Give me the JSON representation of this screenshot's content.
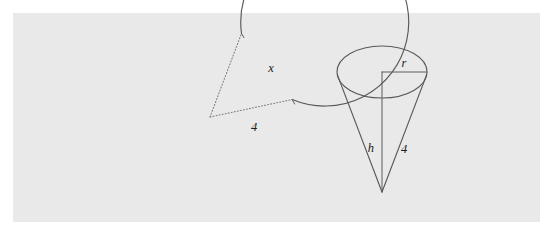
{
  "figure": {
    "background_color": "#ffffff",
    "panel_color": "#e9e9e9",
    "stroke_color": "#59595b",
    "dotted_color": "#7c7c7e",
    "label_color": "#1b1b1b"
  },
  "sector": {
    "name": "circle-with-missing-sector",
    "center": {
      "x": 210,
      "y": 117
    },
    "radius": 84,
    "arc_start_angle_deg": 12,
    "arc_end_angle_deg": 68,
    "labels": {
      "angle": "x",
      "radius": "4"
    },
    "angle_label_pos": {
      "x": 271,
      "y": 72
    },
    "radius_label_pos": {
      "x": 254,
      "y": 131
    }
  },
  "cone": {
    "name": "right-circular-cone",
    "apex": {
      "x": 382,
      "y": 192
    },
    "base_center": {
      "x": 382,
      "y": 72
    },
    "base_rx": 45,
    "base_ry": 26,
    "labels": {
      "radius": "r",
      "height": "h",
      "slant": "4"
    },
    "radius_label_pos": {
      "x": 404,
      "y": 67
    },
    "height_label_pos": {
      "x": 374,
      "y": 152
    },
    "slant_label_pos": {
      "x": 404,
      "y": 153
    }
  }
}
